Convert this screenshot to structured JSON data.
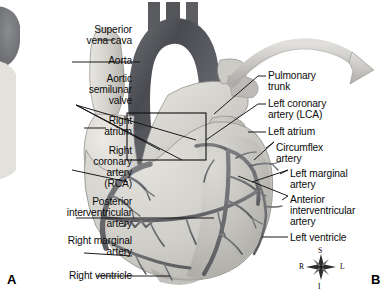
{
  "figure": {
    "panel_a_marker": "A",
    "panel_b_marker": "B",
    "background_color": "#ffffff",
    "ink_color": "#111111"
  },
  "labels_left": [
    {
      "id": "superior-vena-cava",
      "lines": [
        "Superior",
        "vena cava"
      ],
      "x": 36,
      "y": 24,
      "width": 96
    },
    {
      "id": "aorta",
      "lines": [
        "Aorta"
      ],
      "x": 36,
      "y": 55,
      "width": 96
    },
    {
      "id": "aortic-semilunar-valve",
      "lines": [
        "Aortic",
        "semilunar",
        "valve"
      ],
      "x": 26,
      "y": 73,
      "width": 106
    },
    {
      "id": "right-atrium",
      "lines": [
        "Right",
        "atrium"
      ],
      "x": 36,
      "y": 115,
      "width": 96
    },
    {
      "id": "right-coronary-artery",
      "lines": [
        "Right",
        "coronary",
        "artery",
        "(RCA)"
      ],
      "x": 26,
      "y": 145,
      "width": 106
    },
    {
      "id": "posterior-interventricular-artery",
      "lines": [
        "Posterior",
        "interventricular",
        "artery"
      ],
      "x": 10,
      "y": 196,
      "width": 122
    },
    {
      "id": "right-marginal-artery",
      "lines": [
        "Right marginal",
        "artery"
      ],
      "x": 26,
      "y": 235,
      "width": 106
    },
    {
      "id": "right-ventricle",
      "lines": [
        "Right ventricle"
      ],
      "x": 26,
      "y": 270,
      "width": 106
    }
  ],
  "labels_right": [
    {
      "id": "pulmonary-trunk",
      "lines": [
        "Pulmonary",
        "trunk"
      ],
      "x": 268,
      "y": 70
    },
    {
      "id": "left-coronary-artery",
      "lines": [
        "Left coronary",
        "artery (LCA)"
      ],
      "x": 268,
      "y": 98
    },
    {
      "id": "left-atrium",
      "lines": [
        "Left atrium"
      ],
      "x": 268,
      "y": 126
    },
    {
      "id": "circumflex-artery",
      "lines": [
        "Circumflex",
        "artery"
      ],
      "x": 276,
      "y": 142
    },
    {
      "id": "left-marginal-artery",
      "lines": [
        "Left marginal",
        "artery"
      ],
      "x": 290,
      "y": 168
    },
    {
      "id": "anterior-interventricular-artery",
      "lines": [
        "Anterior",
        "interventricular",
        "artery"
      ],
      "x": 290,
      "y": 194
    },
    {
      "id": "left-ventricle",
      "lines": [
        "Left ventricle"
      ],
      "x": 290,
      "y": 232
    }
  ],
  "compass": {
    "superior": "S",
    "inferior": "I",
    "right": "R",
    "left": "L",
    "center_x": 321,
    "center_y": 267
  },
  "structures": [
    {
      "id": "aortic-arch",
      "tone": "#595a5e"
    },
    {
      "id": "superior-vena-cava",
      "tone": "#d9d7d2"
    },
    {
      "id": "pulmonary-trunk",
      "tone": "#c9c7c3"
    },
    {
      "id": "right-atrium",
      "tone": "#dedcd7"
    },
    {
      "id": "left-atrium",
      "tone": "#bfbdb9"
    },
    {
      "id": "right-ventricle",
      "tone": "#cfcdc8"
    },
    {
      "id": "left-ventricle",
      "tone": "#b8b6b2"
    },
    {
      "id": "coronary-vessels",
      "tone": "#6d6e72"
    }
  ],
  "callout_rectangle": {
    "x": 127,
    "y": 113,
    "width": 79,
    "height": 47
  },
  "curved_arrow": {
    "id": "magnification-arrow",
    "tone": "#c4c3bf"
  }
}
